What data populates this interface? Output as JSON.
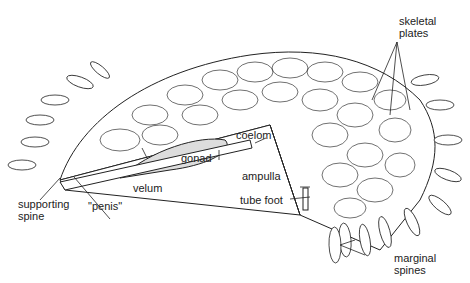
{
  "diagram": {
    "labels": {
      "skeletal_plates": [
        "skeletal",
        "plates"
      ],
      "coelom": "coelom",
      "gonad": "gonad",
      "velum": "velum",
      "penis": "\"penis\"",
      "supporting_spine": [
        "supporting",
        "spine"
      ],
      "ampulla": "ampulla",
      "tube_foot": "tube foot",
      "marginal_spines": [
        "marginal",
        "spines"
      ]
    }
  }
}
